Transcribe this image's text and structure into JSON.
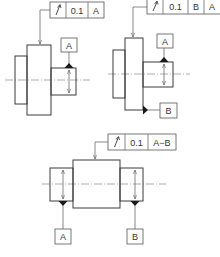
{
  "figures": [
    {
      "id": "fig1",
      "feature_control_frame": {
        "symbol": "↗",
        "symbol_name": "circular-runout",
        "tolerance": "0.1",
        "datums": [
          "A"
        ]
      },
      "datum_labels": [
        "A"
      ]
    },
    {
      "id": "fig2",
      "feature_control_frame": {
        "symbol": "↗",
        "symbol_name": "circular-runout",
        "tolerance": "0.1",
        "datums": [
          "B",
          "A"
        ]
      },
      "datum_labels": [
        "A",
        "B"
      ]
    },
    {
      "id": "fig3",
      "feature_control_frame": {
        "symbol": "↗",
        "symbol_name": "circular-runout",
        "tolerance": "0.1",
        "datums": [
          "A−B"
        ]
      },
      "datum_labels": [
        "A",
        "B"
      ]
    }
  ],
  "colors": {
    "line": "#3a3a3a",
    "datum_triangle": "#1a1a1a",
    "background": "#ffffff"
  }
}
